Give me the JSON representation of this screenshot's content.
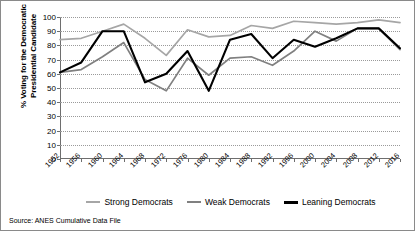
{
  "chart_data": {
    "type": "line",
    "title": "",
    "xlabel": "",
    "ylabel": "% Voting for the Democratic Presidential Candidate",
    "ylim": [
      0,
      100
    ],
    "yticks": [
      0,
      10,
      20,
      30,
      40,
      50,
      60,
      70,
      80,
      90,
      100
    ],
    "grid": true,
    "legend_position": "bottom",
    "categories": [
      "1952",
      "1956",
      "1960",
      "1964",
      "1968",
      "1972",
      "1976",
      "1980",
      "1984",
      "1988",
      "1992",
      "1996",
      "2000",
      "2004",
      "2008",
      "2012",
      "2016"
    ],
    "series": [
      {
        "name": "Strong Democrats",
        "color": "#a6a6a6",
        "values": [
          84,
          85,
          90,
          95,
          85,
          73,
          91,
          86,
          87,
          94,
          92,
          97,
          96,
          95,
          96,
          98,
          96
        ]
      },
      {
        "name": "Weak Democrats",
        "color": "#808080",
        "values": [
          61,
          63,
          72,
          82,
          56,
          48,
          71,
          59,
          71,
          72,
          66,
          76,
          90,
          83,
          92,
          92,
          77
        ]
      },
      {
        "name": "Leaning Democrats",
        "color": "#000000",
        "values": [
          61,
          68,
          90,
          90,
          54,
          60,
          76,
          48,
          84,
          88,
          71,
          84,
          79,
          85,
          92,
          92,
          78
        ]
      }
    ],
    "annotations": {
      "source": "Source: ANES Cumulative Data File"
    }
  },
  "legend": {
    "items": [
      {
        "label": "Strong Democrats",
        "color": "#a6a6a6"
      },
      {
        "label": "Weak Democrats",
        "color": "#808080"
      },
      {
        "label": "Leaning Democrats",
        "color": "#000000"
      }
    ]
  },
  "source_note": "Source: ANES Cumulative Data File"
}
